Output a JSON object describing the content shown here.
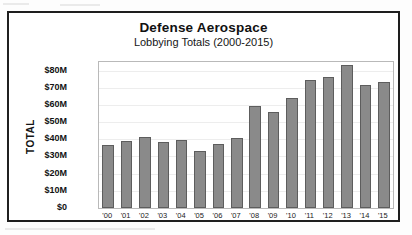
{
  "chart_data": {
    "type": "bar",
    "title": "Defense Aerospace",
    "subtitle": "Lobbying Totals (2000-2015)",
    "xlabel": "",
    "ylabel": "TOTAL",
    "categories": [
      "'00",
      "'01",
      "'02",
      "'03",
      "'04",
      "'05",
      "'06",
      "'07",
      "'08",
      "'09",
      "'10",
      "'11",
      "'12",
      "'13",
      "'14",
      "'15"
    ],
    "values": [
      36.8,
      39.3,
      41.5,
      38.2,
      39.5,
      33.3,
      37.0,
      40.8,
      59.2,
      55.8,
      63.8,
      74.8,
      76.5,
      83.0,
      71.8,
      73.6
    ],
    "ylim": [
      0,
      85
    ],
    "ytick_values": [
      0,
      10,
      20,
      30,
      40,
      50,
      60,
      70,
      80
    ],
    "ytick_labels": [
      "$0",
      "$10M",
      "$20M",
      "$30M",
      "$40M",
      "$50M",
      "$60M",
      "$70M",
      "$80M"
    ],
    "grid": true,
    "legend": "none",
    "bar_color": "#8a8a8a",
    "bar_border_color": "#5d5d5d",
    "frame_color": "#1e1e1e"
  }
}
